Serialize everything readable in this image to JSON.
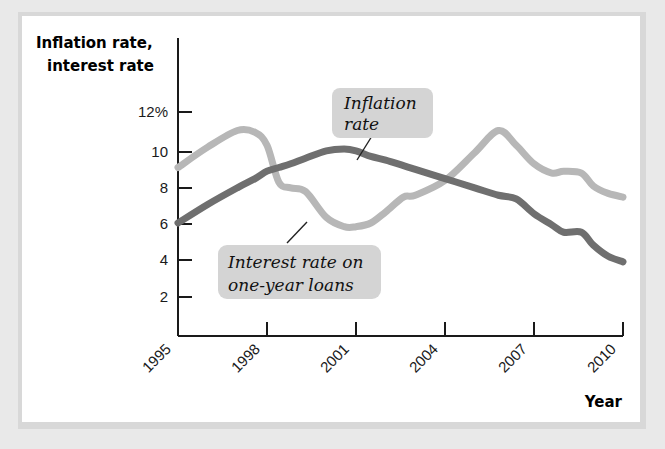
{
  "figure": {
    "background_color": "#ffffff",
    "frame_color": "#d8d8d8"
  },
  "chart_data": {
    "type": "line",
    "title": "",
    "subtitle": "",
    "xlabel": "Year",
    "ylabel": "Inflation rate, interest rate",
    "ylabel_line1": "Inflation rate,",
    "ylabel_line2": "interest rate",
    "grid": false,
    "legend_position": "annotations",
    "xlim": [
      1995,
      2010
    ],
    "ylim": [
      0,
      13
    ],
    "xticks": [
      1995,
      1998,
      2001,
      2004,
      2007,
      2010
    ],
    "xtick_labels": [
      "1995",
      "1998",
      "2001",
      "2004",
      "2007",
      "2010"
    ],
    "yticks": [
      2,
      4,
      6,
      8,
      10,
      12
    ],
    "ytick_labels": [
      "2",
      "4",
      "6",
      "8",
      "10",
      "12%"
    ],
    "x": [
      1995,
      1996,
      1997,
      1997.6,
      1998,
      1998.4,
      1998.8,
      1999.3,
      2000,
      2000.6,
      2001,
      2001.5,
      2002,
      2002.6,
      2003,
      2004,
      2005,
      2005.8,
      2006.4,
      2007,
      2007.6,
      2008,
      2008.6,
      2009,
      2009.5,
      2010
    ],
    "series": [
      {
        "name": "Interest rate on one-year loans",
        "color": "#b7b7b7",
        "stroke_width": 7,
        "values": [
          9.0,
          10.1,
          11.0,
          10.9,
          10.2,
          8.2,
          7.9,
          7.7,
          6.3,
          5.8,
          5.8,
          6.0,
          6.6,
          7.4,
          7.5,
          8.3,
          9.8,
          11.0,
          10.2,
          9.2,
          8.7,
          8.8,
          8.7,
          8.0,
          7.6,
          7.4
        ]
      },
      {
        "name": "Inflation rate",
        "color": "#6f6f6f",
        "stroke_width": 7,
        "values": [
          6.0,
          7.0,
          7.9,
          8.4,
          8.8,
          9.0,
          9.2,
          9.5,
          9.9,
          10.0,
          9.9,
          9.6,
          9.4,
          9.1,
          8.9,
          8.4,
          7.9,
          7.5,
          7.3,
          6.5,
          5.9,
          5.5,
          5.5,
          4.8,
          4.2,
          3.9
        ]
      }
    ],
    "annotations": [
      {
        "id": "inflation-rate-callout",
        "text_line1": "Inflation",
        "text_line2": "rate",
        "full_text": "Inflation rate",
        "box_color": "#d4d4d4",
        "points_to_series": "Inflation rate"
      },
      {
        "id": "interest-rate-callout",
        "text_line1": "Interest rate on",
        "text_line2": "one-year loans",
        "full_text": "Interest rate on one-year loans",
        "box_color": "#d4d4d4",
        "points_to_series": "Interest rate on one-year loans"
      }
    ]
  }
}
